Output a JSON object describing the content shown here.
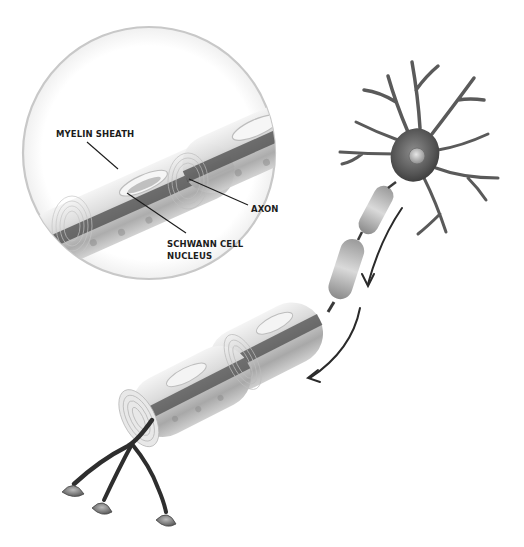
{
  "diagram": {
    "inset": {
      "description": "Magnified cross-section of myelinated axon segment",
      "labels": [
        {
          "id": "myelin-sheath",
          "text": "MYELIN SHEATH"
        },
        {
          "id": "axon",
          "text": "AXON"
        },
        {
          "id": "schwann-cell-nucleus",
          "lines": [
            "SCHWANN CELL",
            "NUCLEUS"
          ]
        }
      ]
    },
    "parts": [
      "cell-body",
      "nucleus",
      "dendrites",
      "axon",
      "myelin-segments",
      "nodes-of-ranvier",
      "axon-terminals",
      "signal-direction-arrows"
    ],
    "colors": {
      "background": "#ffffff",
      "ink": "#1c1c1c",
      "cell_body": "#5e5e5e",
      "myelin_light": "#e2e2e2",
      "myelin_dark": "#9a9a9a",
      "axon_core": "#3c3c3c",
      "inset_ring": "#c8c8c8"
    }
  }
}
